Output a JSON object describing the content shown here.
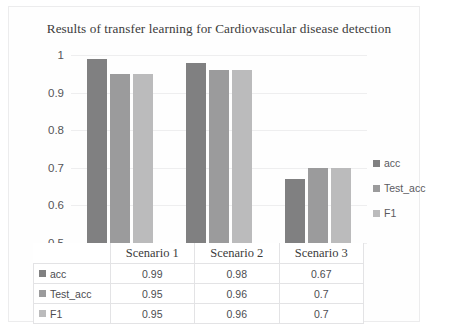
{
  "chart_data": {
    "type": "bar",
    "title": "Results of transfer learning for Cardiovascular disease detection",
    "xlabel": "",
    "ylabel": "",
    "categories": [
      "Scenario 1",
      "Scenario 2",
      "Scenario 3"
    ],
    "series": [
      {
        "name": "acc",
        "values": [
          0.99,
          0.98,
          0.67
        ],
        "color": "#808081"
      },
      {
        "name": "Test_acc",
        "values": [
          0.95,
          0.96,
          0.7
        ],
        "color": "#9b9b9c"
      },
      {
        "name": "F1",
        "values": [
          0.95,
          0.96,
          0.7
        ],
        "color": "#bbbbbc"
      }
    ],
    "ylim": [
      0.5,
      1
    ],
    "yticks": [
      "1",
      "0.9",
      "0.8",
      "0.7",
      "0.6",
      "0.5"
    ],
    "ytick_values": [
      1,
      0.9,
      0.8,
      0.7,
      0.6,
      0.5
    ],
    "grid": true,
    "legend_position": "right",
    "data_table_visible": true
  },
  "legend": {
    "items": [
      {
        "label": "acc",
        "color": "#808081"
      },
      {
        "label": "Test_acc",
        "color": "#9b9b9c"
      },
      {
        "label": "F1",
        "color": "#bbbbbc"
      }
    ]
  },
  "table": {
    "corner": "",
    "columns": [
      "Scenario 1",
      "Scenario 2",
      "Scenario 3"
    ],
    "rows": [
      {
        "label": "acc",
        "color": "#808081",
        "cells": [
          "0.99",
          "0.98",
          "0.67"
        ]
      },
      {
        "label": "Test_acc",
        "color": "#9b9b9c",
        "cells": [
          "0.95",
          "0.96",
          "0.7"
        ]
      },
      {
        "label": "F1",
        "color": "#bbbbbc",
        "cells": [
          "0.95",
          "0.96",
          "0.7"
        ]
      }
    ]
  },
  "caption": ""
}
